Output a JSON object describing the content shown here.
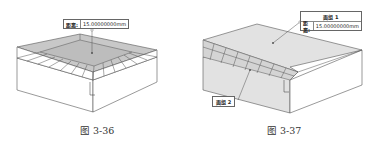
{
  "figures": [
    {
      "caption": "图 3-36",
      "callout": {
        "label": "距离:",
        "value": "15.00000000mm"
      }
    },
    {
      "caption": "图 3-37",
      "callout_title": "面组 1",
      "callout": {
        "label": "距离:",
        "value": "15.00000000mm"
      },
      "tag": "面组 2"
    }
  ],
  "colors": {
    "stroke": "#555555",
    "shaded": "#c8c8c8",
    "light_shaded": "#e2e2e2"
  }
}
